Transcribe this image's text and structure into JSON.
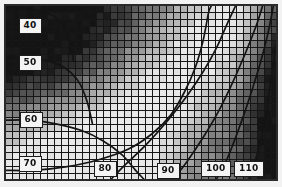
{
  "figure": {
    "type": "contour-over-heatmap",
    "width": 282,
    "height": 187,
    "background_color": "#f2f2f2",
    "frame_color": "#2a2a2a",
    "label_box_fill": "#f4f4f4",
    "label_box_border": "#1c1c1c",
    "contour_line_color": "#141414"
  },
  "chart_data": {
    "type": "heatmap",
    "title": "",
    "subtitle": "",
    "xlabel": "",
    "ylabel": "",
    "grid": true,
    "legend": "none",
    "colormap": "grayscale",
    "xlim": [
      0,
      1
    ],
    "ylim": [
      0,
      1
    ],
    "grid_cells_x": 39,
    "grid_cells_y": 25,
    "cell_size_px": 7,
    "contour_levels": [
      40,
      50,
      60,
      70,
      80,
      90,
      100,
      110
    ],
    "contour_labels": [
      {
        "value": "40",
        "x": 30,
        "y": 26,
        "name": "contour-label-40"
      },
      {
        "value": "50",
        "x": 30,
        "y": 63,
        "name": "contour-label-50"
      },
      {
        "value": "60",
        "x": 31,
        "y": 120,
        "name": "contour-label-60"
      },
      {
        "value": "70",
        "x": 30,
        "y": 164,
        "name": "contour-label-70"
      },
      {
        "value": "80",
        "x": 105,
        "y": 169,
        "name": "contour-label-80"
      },
      {
        "value": "90",
        "x": 168,
        "y": 171,
        "name": "contour-label-90"
      },
      {
        "value": "100",
        "x": 216,
        "y": 169,
        "name": "contour-label-100"
      },
      {
        "value": "110",
        "x": 249,
        "y": 169,
        "name": "contour-label-110"
      }
    ],
    "contours": [
      {
        "level": 40,
        "points": [
          [
            0.0,
            0.0
          ],
          [
            0.1,
            0.02
          ],
          [
            0.18,
            0.06
          ],
          [
            0.22,
            0.13
          ],
          [
            0.24,
            0.22
          ],
          [
            0.25,
            0.32
          ]
        ]
      },
      {
        "level": 50,
        "points": [
          [
            0.0,
            0.3
          ],
          [
            0.08,
            0.3
          ],
          [
            0.16,
            0.32
          ],
          [
            0.22,
            0.36
          ],
          [
            0.27,
            0.44
          ],
          [
            0.3,
            0.55
          ],
          [
            0.32,
            0.68
          ]
        ]
      },
      {
        "level": 60,
        "points": [
          [
            0.0,
            0.66
          ],
          [
            0.09,
            0.66
          ],
          [
            0.18,
            0.68
          ],
          [
            0.28,
            0.72
          ],
          [
            0.36,
            0.78
          ],
          [
            0.43,
            0.86
          ],
          [
            0.48,
            0.95
          ],
          [
            0.51,
            1.0
          ]
        ]
      },
      {
        "level": 70,
        "points": [
          [
            0.0,
            0.95
          ],
          [
            0.1,
            0.95
          ],
          [
            0.22,
            0.93
          ],
          [
            0.34,
            0.89
          ],
          [
            0.45,
            0.83
          ],
          [
            0.54,
            0.74
          ],
          [
            0.61,
            0.63
          ],
          [
            0.66,
            0.5
          ],
          [
            0.7,
            0.36
          ],
          [
            0.73,
            0.2
          ],
          [
            0.75,
            0.04
          ],
          [
            0.76,
            0.0
          ]
        ]
      },
      {
        "level": 80,
        "points": [
          [
            0.39,
            1.0
          ],
          [
            0.44,
            0.92
          ],
          [
            0.52,
            0.8
          ],
          [
            0.6,
            0.66
          ],
          [
            0.67,
            0.52
          ],
          [
            0.73,
            0.38
          ],
          [
            0.78,
            0.24
          ],
          [
            0.82,
            0.1
          ],
          [
            0.85,
            0.0
          ]
        ]
      },
      {
        "level": 90,
        "points": [
          [
            0.62,
            1.0
          ],
          [
            0.67,
            0.9
          ],
          [
            0.73,
            0.76
          ],
          [
            0.79,
            0.6
          ],
          [
            0.84,
            0.44
          ],
          [
            0.89,
            0.26
          ],
          [
            0.93,
            0.1
          ],
          [
            0.95,
            0.0
          ]
        ]
      },
      {
        "level": 100,
        "points": [
          [
            0.78,
            1.0
          ],
          [
            0.82,
            0.88
          ],
          [
            0.86,
            0.72
          ],
          [
            0.9,
            0.54
          ],
          [
            0.94,
            0.34
          ],
          [
            0.97,
            0.16
          ],
          [
            0.99,
            0.0
          ]
        ]
      },
      {
        "level": 110,
        "points": [
          [
            0.9,
            1.0
          ],
          [
            0.93,
            0.86
          ],
          [
            0.96,
            0.66
          ],
          [
            0.98,
            0.44
          ],
          [
            1.0,
            0.22
          ]
        ]
      }
    ],
    "intensity_notes": {
      "description": "Grayscale cell intensities; dark at left/top-left and far right, bright band sweeping from lower-left up through upper-middle-right",
      "min_gray": "#0d0d0d",
      "max_gray": "#f0f0f0"
    }
  }
}
